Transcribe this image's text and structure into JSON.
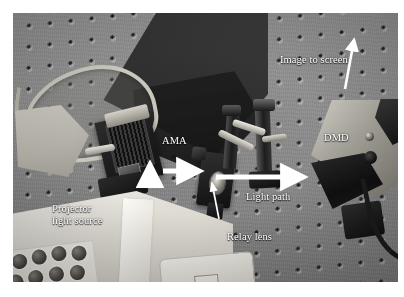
{
  "figure": {
    "kind": "photograph",
    "frame_color": "#ffffff",
    "photo_tone": "grayscale"
  },
  "annotations": {
    "image_to_screen": {
      "label": "Image to screen",
      "arrow": "up-right",
      "color": "#ffffff"
    },
    "dmd": {
      "label": "DMD",
      "color": "#ffffff"
    },
    "ama": {
      "label": "AMA",
      "color": "#ffffff"
    },
    "light_path": {
      "label": "Light path",
      "arrow": "right",
      "color": "#ffffff"
    },
    "relay_lens": {
      "label": "Relay lens",
      "arrow": "up",
      "color": "#ffffff"
    },
    "projector_light_source": {
      "line1": "Projector",
      "line2": "light source",
      "arrow": "up",
      "color": "#ffffff"
    }
  },
  "scene": {
    "components": [
      "optical breadboard table",
      "AMA module",
      "relay lens mount",
      "kinematic posts",
      "DMD module",
      "projector light source",
      "white paper sheet",
      "cable loop"
    ]
  }
}
